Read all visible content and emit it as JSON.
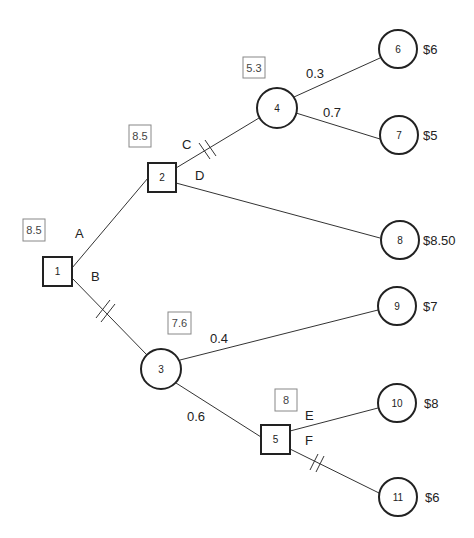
{
  "diagram": {
    "type": "decision-tree",
    "nodes": {
      "n1": {
        "label": "1",
        "kind": "decision",
        "value": "8.5"
      },
      "n2": {
        "label": "2",
        "kind": "decision",
        "value": "8.5"
      },
      "n3": {
        "label": "3",
        "kind": "chance",
        "value": "7.6"
      },
      "n4": {
        "label": "4",
        "kind": "chance",
        "value": "5.3"
      },
      "n5": {
        "label": "5",
        "kind": "decision",
        "value": "8"
      },
      "n6": {
        "label": "6",
        "kind": "terminal",
        "payoff": "$6"
      },
      "n7": {
        "label": "7",
        "kind": "terminal",
        "payoff": "$5"
      },
      "n8": {
        "label": "8",
        "kind": "terminal",
        "payoff": "$8.50"
      },
      "n9": {
        "label": "9",
        "kind": "terminal",
        "payoff": "$7"
      },
      "n10": {
        "label": "10",
        "kind": "terminal",
        "payoff": "$8"
      },
      "n11": {
        "label": "11",
        "kind": "terminal",
        "payoff": "$6"
      }
    },
    "edges": {
      "A": {
        "label": "A",
        "from": "1",
        "to": "2",
        "pruned": false
      },
      "B": {
        "label": "B",
        "from": "1",
        "to": "3",
        "pruned": true
      },
      "C": {
        "label": "C",
        "from": "2",
        "to": "4",
        "pruned": true
      },
      "D": {
        "label": "D",
        "from": "2",
        "to": "8",
        "pruned": false
      },
      "e4_6": {
        "label": "0.3",
        "from": "4",
        "to": "6"
      },
      "e4_7": {
        "label": "0.7",
        "from": "4",
        "to": "7"
      },
      "e3_9": {
        "label": "0.4",
        "from": "3",
        "to": "9"
      },
      "e3_5": {
        "label": "0.6",
        "from": "3",
        "to": "5"
      },
      "E": {
        "label": "E",
        "from": "5",
        "to": "10",
        "pruned": false
      },
      "F": {
        "label": "F",
        "from": "5",
        "to": "11",
        "pruned": true
      }
    }
  }
}
